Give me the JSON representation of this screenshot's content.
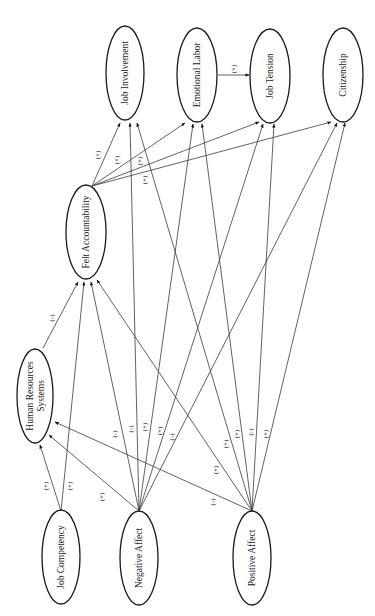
{
  "diagram": {
    "orientation": "rotated-90-ccw",
    "nodes": [
      {
        "id": "job_involvement",
        "label": "Job Involvement",
        "cx": 125,
        "cy": 73
      },
      {
        "id": "emotional_labor",
        "label": "Emotional Labor",
        "cx": 197,
        "cy": 75
      },
      {
        "id": "job_tension",
        "label": "Job Tension",
        "cx": 270,
        "cy": 76
      },
      {
        "id": "citizenship",
        "label": "Citizenship",
        "cx": 343,
        "cy": 75
      },
      {
        "id": "felt_accountability",
        "label": "Felt Accountability",
        "cx": 86,
        "cy": 232
      },
      {
        "id": "hr_systems",
        "label_line1": "Human Resources",
        "label_line2": "Systems",
        "cx": 35,
        "cy": 396
      },
      {
        "id": "job_competency",
        "label": "Job Competency",
        "cx": 61,
        "cy": 557
      },
      {
        "id": "negative_affect",
        "label": "Negative Affect",
        "cx": 139,
        "cy": 558
      },
      {
        "id": "positive_affect",
        "label": "Positive Affect",
        "cx": 252,
        "cy": 558
      }
    ],
    "edges": [
      {
        "from": "emotional_labor",
        "to": "job_tension",
        "sign": "(+)"
      },
      {
        "from": "felt_accountability",
        "to": "job_involvement",
        "sign": "(+)"
      },
      {
        "from": "felt_accountability",
        "to": "emotional_labor",
        "sign": "(+)"
      },
      {
        "from": "felt_accountability",
        "to": "job_tension",
        "sign": "(+)"
      },
      {
        "from": "felt_accountability",
        "to": "citizenship",
        "sign": "(+)"
      },
      {
        "from": "hr_systems",
        "to": "felt_accountability",
        "sign": "(-)"
      },
      {
        "from": "job_competency",
        "to": "hr_systems",
        "sign": "(+)"
      },
      {
        "from": "job_competency",
        "to": "felt_accountability",
        "sign": "(+)"
      },
      {
        "from": "negative_affect",
        "to": "hr_systems",
        "sign": "(+)"
      },
      {
        "from": "negative_affect",
        "to": "felt_accountability",
        "sign": "(-)"
      },
      {
        "from": "negative_affect",
        "to": "job_involvement",
        "sign": "(-)"
      },
      {
        "from": "negative_affect",
        "to": "emotional_labor",
        "sign": "(+)"
      },
      {
        "from": "negative_affect",
        "to": "job_tension",
        "sign": "(+)"
      },
      {
        "from": "negative_affect",
        "to": "citizenship",
        "sign": "(-)"
      },
      {
        "from": "positive_affect",
        "to": "hr_systems",
        "sign": "(-)"
      },
      {
        "from": "positive_affect",
        "to": "felt_accountability",
        "sign": "(+)"
      },
      {
        "from": "positive_affect",
        "to": "job_involvement",
        "sign": "(+)"
      },
      {
        "from": "positive_affect",
        "to": "emotional_labor",
        "sign": "(+)"
      },
      {
        "from": "positive_affect",
        "to": "job_tension",
        "sign": "(-)"
      },
      {
        "from": "positive_affect",
        "to": "citizenship",
        "sign": "(+)"
      }
    ]
  }
}
